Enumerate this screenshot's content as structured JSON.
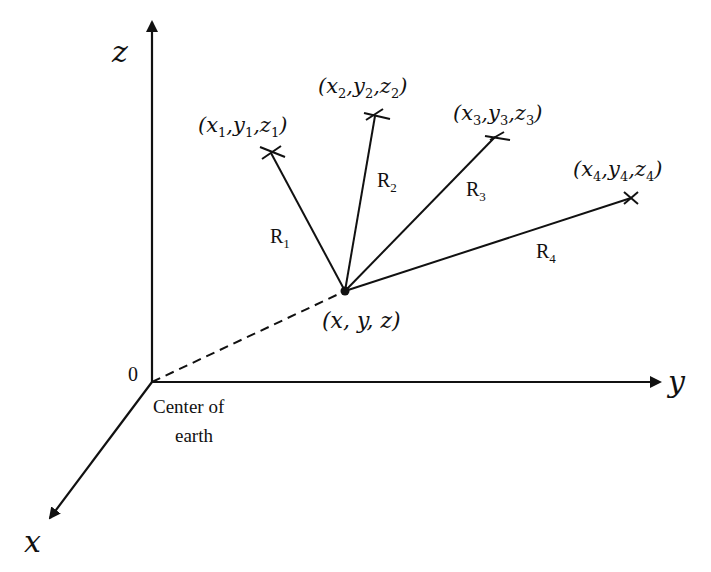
{
  "diagram": {
    "type": "3d-coordinate-trilateration",
    "axes": {
      "z": {
        "label": "z"
      },
      "y": {
        "label": "y"
      },
      "x": {
        "label": "x"
      },
      "origin": {
        "label": "0",
        "caption_line1": "Center of",
        "caption_line2": "earth"
      }
    },
    "receiver": {
      "label": "(x, y, z)"
    },
    "satellites": [
      {
        "id": "1",
        "label_var": [
          "x",
          "y",
          "z"
        ],
        "sub": "1",
        "range_label": "R",
        "range_sub": "1"
      },
      {
        "id": "2",
        "label_var": [
          "x",
          "y",
          "z"
        ],
        "sub": "2",
        "range_label": "R",
        "range_sub": "2"
      },
      {
        "id": "3",
        "label_var": [
          "x",
          "y",
          "z"
        ],
        "sub": "3",
        "range_label": "R",
        "range_sub": "3"
      },
      {
        "id": "4",
        "label_var": [
          "x",
          "y",
          "z"
        ],
        "sub": "4",
        "range_label": "R",
        "range_sub": "4"
      }
    ],
    "colors": {
      "ink": "#111111",
      "background": "#ffffff"
    }
  }
}
